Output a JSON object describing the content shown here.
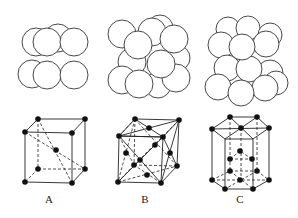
{
  "figure": {
    "panels": [
      {
        "id": "A",
        "label": "A",
        "structure": "body-centered cubic",
        "spheres": [
          {
            "cx": 58,
            "cy": 38,
            "r": 14
          },
          {
            "cx": 36,
            "cy": 42,
            "r": 14
          },
          {
            "cx": 32,
            "cy": 74,
            "r": 14
          },
          {
            "cx": 47,
            "cy": 42,
            "r": 14
          },
          {
            "cx": 74,
            "cy": 42,
            "r": 14
          },
          {
            "cx": 47,
            "cy": 75,
            "r": 14
          },
          {
            "cx": 74,
            "cy": 75,
            "r": 14
          }
        ]
      },
      {
        "id": "B",
        "label": "B",
        "structure": "face-centered cubic",
        "spheres": [
          {
            "cx": 160,
            "cy": 28,
            "r": 13
          },
          {
            "cx": 152,
            "cy": 32,
            "r": 14
          },
          {
            "cx": 122,
            "cy": 34,
            "r": 14
          },
          {
            "cx": 158,
            "cy": 85,
            "r": 13
          },
          {
            "cx": 177,
            "cy": 58,
            "r": 13
          },
          {
            "cx": 132,
            "cy": 62,
            "r": 14
          },
          {
            "cx": 122,
            "cy": 80,
            "r": 14
          },
          {
            "cx": 176,
            "cy": 78,
            "r": 14
          },
          {
            "cx": 174,
            "cy": 39,
            "r": 14
          },
          {
            "cx": 138,
            "cy": 45,
            "r": 14
          },
          {
            "cx": 161,
            "cy": 64,
            "r": 14
          },
          {
            "cx": 139,
            "cy": 84,
            "r": 14
          }
        ]
      },
      {
        "id": "C",
        "label": "C",
        "structure": "hexagonal close-packed",
        "spheres": [
          {
            "cx": 228,
            "cy": 29,
            "r": 12
          },
          {
            "cx": 248,
            "cy": 28,
            "r": 12
          },
          {
            "cx": 270,
            "cy": 35,
            "r": 12
          },
          {
            "cx": 221,
            "cy": 45,
            "r": 13
          },
          {
            "cx": 266,
            "cy": 44,
            "r": 13
          },
          {
            "cx": 270,
            "cy": 73,
            "r": 13
          },
          {
            "cx": 227,
            "cy": 68,
            "r": 13
          },
          {
            "cx": 276,
            "cy": 83,
            "r": 12
          },
          {
            "cx": 249,
            "cy": 69,
            "r": 13
          },
          {
            "cx": 242,
            "cy": 47,
            "r": 13
          },
          {
            "cx": 218,
            "cy": 87,
            "r": 13
          },
          {
            "cx": 265,
            "cy": 88,
            "r": 13
          },
          {
            "cx": 241,
            "cy": 93,
            "r": 13
          }
        ]
      }
    ],
    "lattices": [
      {
        "id": "A",
        "solid_edges": [
          [
            38,
            119,
            85,
            119
          ],
          [
            25,
            132,
            72,
            133
          ],
          [
            38,
            119,
            25,
            132
          ],
          [
            85,
            119,
            72,
            133
          ],
          [
            25,
            132,
            25,
            182
          ],
          [
            72,
            133,
            72,
            183
          ],
          [
            85,
            119,
            85,
            169
          ],
          [
            25,
            182,
            72,
            183
          ],
          [
            72,
            183,
            85,
            169
          ]
        ],
        "dashed_edges": [
          [
            38,
            119,
            38,
            169
          ],
          [
            38,
            169,
            85,
            169
          ],
          [
            38,
            169,
            25,
            182
          ],
          [
            38,
            119,
            72,
            183
          ],
          [
            25,
            132,
            85,
            169
          ]
        ],
        "atoms": [
          [
            38,
            119
          ],
          [
            85,
            119
          ],
          [
            25,
            132
          ],
          [
            72,
            133
          ],
          [
            56,
            150
          ],
          [
            38,
            169
          ],
          [
            85,
            169
          ],
          [
            25,
            182
          ],
          [
            72,
            183
          ]
        ]
      },
      {
        "id": "B",
        "solid_edges": [
          [
            135,
            119,
            179,
            120
          ],
          [
            119,
            136,
            163,
            137
          ],
          [
            135,
            119,
            119,
            136
          ],
          [
            179,
            120,
            163,
            137
          ],
          [
            119,
            136,
            118,
            182
          ],
          [
            163,
            137,
            161,
            183
          ],
          [
            179,
            120,
            177,
            166
          ],
          [
            118,
            182,
            161,
            183
          ],
          [
            161,
            183,
            177,
            166
          ],
          [
            119,
            136,
            163,
            137
          ],
          [
            135,
            119,
            163,
            137
          ],
          [
            119,
            136,
            179,
            120
          ],
          [
            119,
            136,
            161,
            183
          ],
          [
            118,
            182,
            163,
            137
          ],
          [
            163,
            137,
            177,
            166
          ],
          [
            179,
            120,
            161,
            183
          ]
        ],
        "dashed_edges": [
          [
            135,
            119,
            134,
            165
          ],
          [
            134,
            165,
            177,
            166
          ],
          [
            134,
            165,
            118,
            182
          ],
          [
            135,
            119,
            119,
            136
          ],
          [
            135,
            119,
            118,
            182
          ],
          [
            119,
            136,
            134,
            165
          ],
          [
            135,
            119,
            177,
            166
          ],
          [
            179,
            120,
            134,
            165
          ],
          [
            118,
            182,
            177,
            166
          ],
          [
            161,
            183,
            134,
            165
          ]
        ],
        "atoms": [
          [
            135,
            119
          ],
          [
            179,
            120
          ],
          [
            119,
            136
          ],
          [
            163,
            137
          ],
          [
            149,
            128
          ],
          [
            140,
            160
          ],
          [
            126,
            153
          ],
          [
            170,
            153
          ],
          [
            155,
            145
          ],
          [
            134,
            165
          ],
          [
            177,
            166
          ],
          [
            147,
            175
          ],
          [
            118,
            182
          ],
          [
            161,
            183
          ]
        ]
      },
      {
        "id": "C",
        "solid_edges": [
          [
            230,
            117,
            257,
            117
          ],
          [
            257,
            117,
            269,
            128
          ],
          [
            269,
            128,
            253,
            139
          ],
          [
            253,
            139,
            225,
            139
          ],
          [
            225,
            139,
            212,
            129
          ],
          [
            212,
            129,
            230,
            117
          ],
          [
            212,
            129,
            269,
            128
          ],
          [
            230,
            117,
            253,
            139
          ],
          [
            257,
            117,
            225,
            139
          ],
          [
            212,
            129,
            212,
            180
          ],
          [
            269,
            128,
            269,
            180
          ],
          [
            225,
            139,
            225,
            189
          ],
          [
            253,
            139,
            253,
            189
          ],
          [
            212,
            180,
            225,
            189
          ],
          [
            225,
            189,
            253,
            189
          ],
          [
            253,
            189,
            269,
            180
          ]
        ],
        "dashed_edges": [
          [
            230,
            117,
            230,
            171
          ],
          [
            257,
            117,
            257,
            171
          ],
          [
            241,
            128,
            241,
            180
          ],
          [
            212,
            180,
            230,
            171
          ],
          [
            230,
            171,
            257,
            171
          ],
          [
            257,
            171,
            269,
            180
          ],
          [
            212,
            180,
            269,
            180
          ],
          [
            230,
            171,
            253,
            189
          ],
          [
            257,
            171,
            225,
            189
          ],
          [
            230,
            159,
            252,
            159
          ],
          [
            230,
            159,
            240,
            151
          ],
          [
            252,
            159,
            240,
            151
          ]
        ],
        "atoms": [
          [
            230,
            117
          ],
          [
            257,
            117
          ],
          [
            212,
            129
          ],
          [
            241,
            128
          ],
          [
            269,
            128
          ],
          [
            240,
            151
          ],
          [
            230,
            159
          ],
          [
            252,
            159
          ],
          [
            230,
            171
          ],
          [
            257,
            171
          ],
          [
            212,
            180
          ],
          [
            240,
            180
          ],
          [
            269,
            180
          ],
          [
            225,
            189
          ],
          [
            253,
            189
          ]
        ]
      }
    ],
    "labels": [
      {
        "text": "A",
        "x": 49,
        "y": 203
      },
      {
        "text": "B",
        "x": 145,
        "y": 203
      },
      {
        "text": "C",
        "x": 240,
        "y": 203
      }
    ]
  }
}
